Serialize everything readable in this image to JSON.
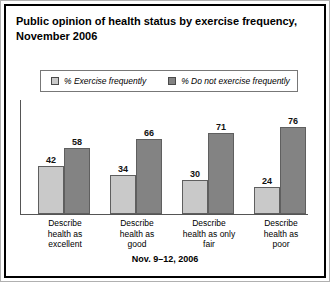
{
  "title": "Public opinion of health status by exercise frequency, November 2006",
  "footer": "Nov. 9–12, 2006",
  "legend": {
    "series": [
      {
        "label": "% Exercise frequently",
        "color": "#c9c9c9",
        "swatch_icon": "legend-swatch-light"
      },
      {
        "label": "% Do not exercise frequently",
        "color": "#838383",
        "swatch_icon": "legend-swatch-dark"
      }
    ]
  },
  "chart_data": {
    "type": "bar",
    "title": "Public opinion of health status by exercise frequency, November 2006",
    "xlabel": "",
    "ylabel": "",
    "ylim": [
      0,
      100
    ],
    "grid": false,
    "legend_position": "top",
    "annotation": "Nov. 9–12, 2006",
    "categories": [
      "Describe health as excellent",
      "Describe health as good",
      "Describe health as only fair",
      "Describe health as poor"
    ],
    "category_lines": [
      [
        "Describe",
        "health as",
        "excellent"
      ],
      [
        "Describe",
        "health as",
        "good"
      ],
      [
        "Describe",
        "health as only",
        "fair"
      ],
      [
        "Describe",
        "health as",
        "poor"
      ]
    ],
    "series": [
      {
        "name": "% Exercise frequently",
        "color": "#c9c9c9",
        "values": [
          42,
          34,
          30,
          24
        ]
      },
      {
        "name": "% Do not exercise frequently",
        "color": "#838383",
        "values": [
          58,
          66,
          71,
          76
        ]
      }
    ]
  }
}
